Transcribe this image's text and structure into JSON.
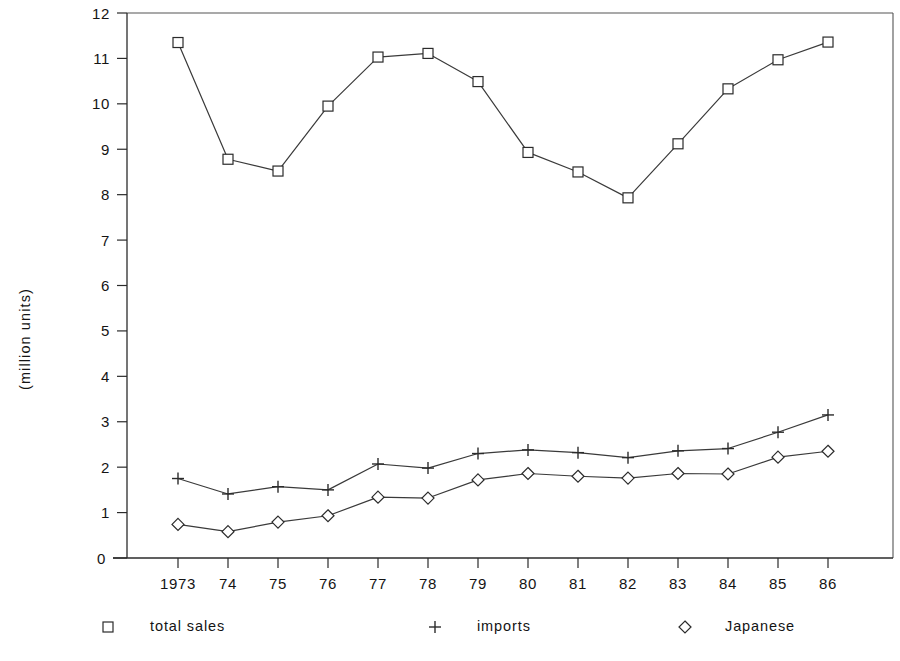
{
  "chart_data": {
    "type": "line",
    "title": "",
    "subtitle": "",
    "xlabel": "",
    "ylabel": "(million units)",
    "xlim": [
      1972.5,
      1986.5
    ],
    "ylim": [
      0,
      12
    ],
    "grid": false,
    "legend_position": "bottom",
    "x": [
      1973,
      1974,
      1975,
      1976,
      1977,
      1978,
      1979,
      1980,
      1981,
      1982,
      1983,
      1984,
      1985,
      1986
    ],
    "categories": [
      "1973",
      "74",
      "75",
      "76",
      "77",
      "78",
      "79",
      "80",
      "81",
      "82",
      "83",
      "84",
      "85",
      "86"
    ],
    "yticks": [
      0,
      1,
      2,
      3,
      4,
      5,
      6,
      7,
      8,
      9,
      10,
      11,
      12
    ],
    "ytick_labels": [
      "0",
      "1",
      "2",
      "3",
      "4",
      "5",
      "6",
      "7",
      "8",
      "9",
      "10",
      "11",
      "12"
    ],
    "series": [
      {
        "name": "total sales",
        "marker": "square",
        "values": [
          11.35,
          8.78,
          8.52,
          9.95,
          11.03,
          11.11,
          10.49,
          8.93,
          8.5,
          7.93,
          9.12,
          10.33,
          10.97,
          11.36
        ]
      },
      {
        "name": "imports",
        "marker": "plus",
        "values": [
          1.75,
          1.41,
          1.57,
          1.5,
          2.07,
          1.98,
          2.3,
          2.38,
          2.32,
          2.21,
          2.36,
          2.41,
          2.77,
          3.15
        ]
      },
      {
        "name": "Japanese",
        "marker": "diamond",
        "values": [
          0.74,
          0.58,
          0.79,
          0.93,
          1.34,
          1.32,
          1.72,
          1.86,
          1.8,
          1.76,
          1.86,
          1.85,
          2.22,
          2.35
        ]
      }
    ]
  },
  "legend": {
    "items": [
      {
        "label": "total sales",
        "marker": "square"
      },
      {
        "label": "imports",
        "marker": "plus"
      },
      {
        "label": "Japanese",
        "marker": "diamond"
      }
    ]
  },
  "colors": {
    "line": "#3a3a3a",
    "marker_stroke": "#2b2b2b",
    "marker_fill": "#ffffff",
    "axis": "#2b2b2b",
    "frame": "#555555",
    "text": "#141414",
    "background": "#ffffff"
  }
}
